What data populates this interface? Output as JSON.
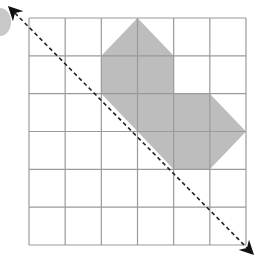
{
  "diagram": {
    "type": "grid-reflection",
    "grid": {
      "cols": 6,
      "rows": 6,
      "line_color": "#9a9a9a"
    },
    "shape": {
      "fill": "#bdbdbd",
      "vertices_grid": [
        [
          3,
          0
        ],
        [
          4,
          1
        ],
        [
          4,
          2
        ],
        [
          5,
          2
        ],
        [
          6,
          3
        ],
        [
          5,
          4
        ],
        [
          4,
          4
        ],
        [
          2,
          2
        ],
        [
          2,
          1
        ]
      ]
    },
    "mirror_line": {
      "style": "dashed",
      "color": "#222222",
      "from": "top-left",
      "to": "bottom-right",
      "arrows": "both"
    },
    "corner_marker": {
      "color": "#c8c8c8"
    }
  }
}
